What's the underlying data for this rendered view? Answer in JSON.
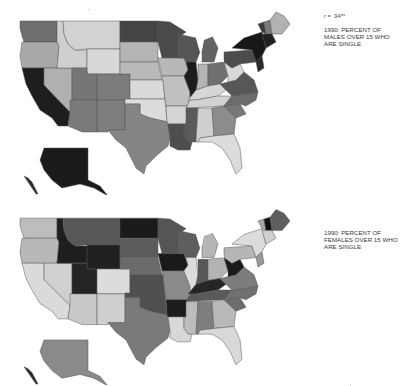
{
  "correlation": {
    "label": "r = .94**"
  },
  "maps": [
    {
      "id": "males",
      "caption": "1990: PERCENT OF MALES OVER 15 WHO ARE SINGLE",
      "shades": {
        "WA": "#6e6e6e",
        "OR": "#a9a9a9",
        "CA": "#1e1e1e",
        "ID": "#cfcfcf",
        "NV": "#b0b0b0",
        "MT": "#d2d2d2",
        "WY": "#d8d8d8",
        "UT": "#767676",
        "CO": "#7c7c7c",
        "AZ": "#7a7a7a",
        "NM": "#7e7e7e",
        "ND": "#444444",
        "SD": "#b5b5b5",
        "NE": "#b9b9b9",
        "KS": "#dadada",
        "OK": "#dcdcdc",
        "TX": "#858585",
        "MN": "#4a4a4a",
        "IA": "#b8b8b8",
        "MO": "#c0c0c0",
        "AR": "#d4d4d4",
        "LA": "#4e4e4e",
        "WI": "#555555",
        "IL": "#1c1c1c",
        "MI": "#636363",
        "IN": "#b4b4b4",
        "OH": "#707070",
        "KY": "#d6d6d6",
        "TN": "#d2d2d2",
        "MS": "#5a5a5a",
        "AL": "#cfcfcf",
        "GA": "#8c8c8c",
        "FL": "#dcdcdc",
        "SC": "#777777",
        "NC": "#6c6c6c",
        "VA": "#575757",
        "WV": "#d8d8d8",
        "PA": "#4c4c4c",
        "NY": "#181818",
        "ME": "#b2b2b2",
        "VT": "#3c3c3c",
        "NH": "#7a7a7a",
        "MA": "#202020",
        "NJ": "#2a2a2a",
        "AK": "#1a1a1a",
        "HI": "#2e2e2e"
      }
    },
    {
      "id": "females",
      "caption": "1990: PERCENT OF FEMALES OVER 15 WHO ARE SINGLE",
      "shades": {
        "WA": "#bdbdbd",
        "OR": "#b8b8b8",
        "CA": "#dadada",
        "ID": "#1e1e1e",
        "NV": "#d0d0d0",
        "MT": "#575757",
        "WY": "#202020",
        "UT": "#242424",
        "CO": "#dcdcdc",
        "AZ": "#c9c9c9",
        "NM": "#cfcfcf",
        "ND": "#1b1b1b",
        "SD": "#5c5c5c",
        "NE": "#6a6a6a",
        "KS": "#4f4f4f",
        "OK": "#505050",
        "TX": "#7a7a7a",
        "MN": "#555555",
        "IA": "#1a1a1a",
        "MO": "#8a8a8a",
        "AR": "#1d1d1d",
        "LA": "#d8d8d8",
        "WI": "#5e5e5e",
        "IL": "#dcdcdc",
        "MI": "#b5b5b5",
        "IN": "#585858",
        "OH": "#b3b3b3",
        "KY": "#262626",
        "TN": "#5a5a5a",
        "MS": "#bcbcbc",
        "AL": "#7e7e7e",
        "GA": "#b9b9b9",
        "FL": "#d9d9d9",
        "SC": "#6c6c6c",
        "NC": "#707070",
        "VA": "#7c7c7c",
        "WV": "#1a1a1a",
        "PA": "#b6b6b6",
        "NY": "#dcdcdc",
        "ME": "#5e5e5e",
        "VT": "#a8a8a8",
        "NH": "#111111",
        "MA": "#cfcfcf",
        "NJ": "#999999",
        "AK": "#8a8a8a",
        "HI": "#2a2a2a"
      }
    }
  ]
}
